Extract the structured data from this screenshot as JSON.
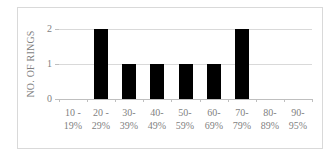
{
  "chart_data": {
    "type": "bar",
    "title": "",
    "xlabel": "",
    "ylabel": "NO. OF RINGS",
    "categories": [
      "10 - 19%",
      "20 - 29%",
      "30- 39%",
      "40- 49%",
      "50- 59%",
      "60- 69%",
      "70- 79%",
      "80- 89%",
      "90- 95%"
    ],
    "category_lines": [
      [
        "10 -",
        "19%"
      ],
      [
        "20 -",
        "29%"
      ],
      [
        "30-",
        "39%"
      ],
      [
        "40-",
        "49%"
      ],
      [
        "50-",
        "59%"
      ],
      [
        "60-",
        "69%"
      ],
      [
        "70-",
        "79%"
      ],
      [
        "80-",
        "89%"
      ],
      [
        "90-",
        "95%"
      ]
    ],
    "values": [
      0,
      2,
      1,
      1,
      1,
      1,
      2,
      0,
      0
    ],
    "ylim": [
      0,
      2
    ],
    "yticks": [
      "0",
      "1",
      "2"
    ],
    "grid": true,
    "legend": null,
    "bar_color": "#000000"
  }
}
